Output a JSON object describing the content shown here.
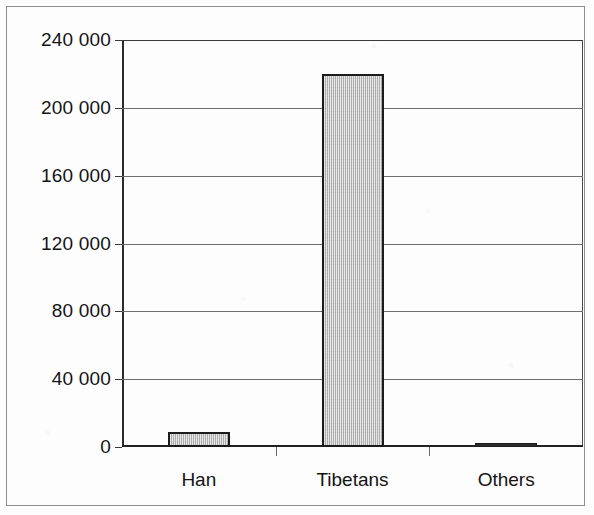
{
  "chart_data": {
    "type": "bar",
    "title": "",
    "subtitle": "",
    "xlabel": "",
    "ylabel": "",
    "categories": [
      "Han",
      "Tibetans",
      "Others"
    ],
    "values": [
      9000,
      220000,
      2000
    ],
    "series": [
      {
        "name": "Population",
        "values": [
          9000,
          220000,
          2000
        ]
      }
    ],
    "ylim": [
      0,
      240000
    ],
    "ytick_values": [
      0,
      40000,
      80000,
      120000,
      160000,
      200000,
      240000
    ],
    "ytick_labels": [
      "0",
      "40 000",
      "80 000",
      "120 000",
      "160 000",
      "200 000",
      "240 000"
    ],
    "grid": true,
    "grid_axis": "y",
    "legend": false,
    "legend_position": "none",
    "annotations": [],
    "bar_fill_color": "#c9c9c9",
    "bar_edge_color": "#1b1b1b",
    "axis_color": "#2b2b2b",
    "grid_color": "#6f6f6f",
    "background_color": "#ffffff"
  },
  "figure": {
    "frame_color": "#8d8d8d"
  }
}
